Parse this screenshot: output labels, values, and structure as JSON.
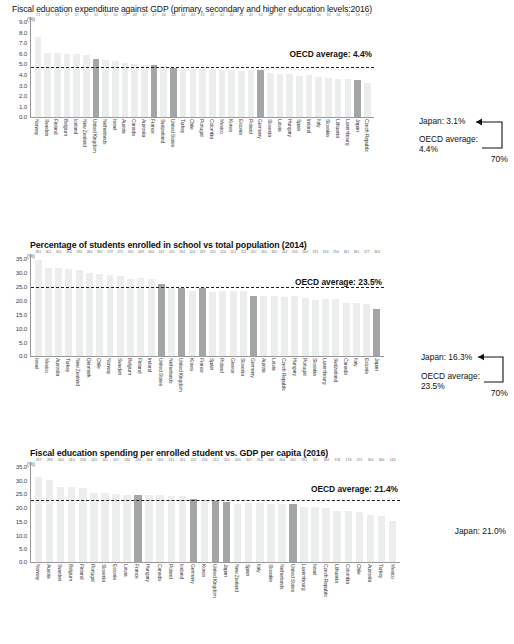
{
  "charts": [
    {
      "id": "chart-gdp-expenditure",
      "title": "Fiscal education expenditure against GDP (primary, secondary and higher education levels:2016)",
      "unit": "(%)",
      "average_label": "OECD average: 4.4%",
      "annotation": {
        "japan": "Japan: 3.1%",
        "oecd_line1": "OECD average:",
        "oecd_line2": "4.4%",
        "rank": "70%"
      },
      "chart_data": {
        "type": "bar",
        "title": "Fiscal education expenditure against GDP (primary, secondary and higher education levels:2016)",
        "xlabel": "",
        "ylabel": "(%)",
        "ylim": [
          0.0,
          9.0
        ],
        "yticks": [
          "0.0",
          "1.0",
          "2.0",
          "3.0",
          "4.0",
          "5.0",
          "6.0",
          "7.0",
          "8.0",
          "9.0"
        ],
        "grid": false,
        "legend": "none",
        "average_line": 4.4,
        "highlight": [
          "United Kingdom",
          "France",
          "United States",
          "Germany",
          "Japan"
        ],
        "categories": [
          "Norway",
          "Sweden",
          "Finland",
          "Belgium",
          "Iceland",
          "New Zealand",
          "United Kingdom",
          "Netherlands",
          "Israel",
          "Austria",
          "Canada",
          "Australia",
          "France",
          "Switzerland",
          "United States",
          "Turkey",
          "Chile",
          "Portugal",
          "Colombia",
          "Mexico",
          "Korea",
          "Estonia",
          "Poland",
          "Germany",
          "Slovenia",
          "Latvia",
          "Hungary",
          "Spain",
          "Ireland",
          "Italy",
          "Slovakia",
          "Lithuania",
          "Luxembourg",
          "Japan",
          "Czech Republic"
        ],
        "values": [
          7.2,
          5.8,
          5.8,
          5.7,
          5.7,
          5.6,
          5.2,
          5.1,
          5.0,
          4.9,
          4.8,
          4.7,
          4.7,
          4.6,
          4.4,
          4.4,
          4.3,
          4.3,
          4.3,
          4.2,
          4.2,
          4.1,
          4.2,
          4.2,
          4.0,
          3.9,
          3.9,
          3.7,
          3.8,
          3.6,
          3.5,
          3.4,
          3.4,
          3.3,
          3.1,
          3.1
        ],
        "value_labels": [
          "7.2",
          "5.8",
          "5.8",
          "5.7",
          "5.7",
          "5.6",
          "5.2",
          "5.1",
          "5.0",
          "4.9",
          "4.8",
          "4.7",
          "4.7",
          "4.6",
          "4.4",
          "4.4",
          "4.3",
          "4.3",
          "4.3",
          "4.2",
          "4.2",
          "4.1",
          "4.2",
          "4.2",
          "4.0",
          "3.9",
          "3.9",
          "3.7",
          "3.8",
          "3.6",
          "3.5",
          "3.4",
          "3.4",
          "3.3",
          "3.1"
        ]
      }
    },
    {
      "id": "chart-students-enrolled",
      "title": "Percentage of students enrolled in school vs total population (2014)",
      "unit": "(%)",
      "average_label": "OECD average: 23.5%",
      "annotation": {
        "japan": "Japan: 16.3%",
        "oecd_line1": "OECD average:",
        "oecd_line2": "23.5%",
        "rank": "70%"
      },
      "chart_data": {
        "type": "bar",
        "title": "Percentage of students enrolled in school vs total population (2014)",
        "xlabel": "",
        "ylabel": "(%)",
        "ylim": [
          0.0,
          35.0
        ],
        "yticks": [
          "0.0",
          "5.0",
          "10.0",
          "15.0",
          "20.0",
          "25.0",
          "30.0",
          "35.0"
        ],
        "grid": false,
        "legend": "none",
        "average_line": 23.5,
        "highlight": [
          "United States",
          "United Kingdom",
          "France",
          "Germany",
          "Japan"
        ],
        "categories": [
          "Israel",
          "Mexico",
          "Australia",
          "Turkey",
          "New Zealand",
          "Denmark",
          "Chile",
          "Norway",
          "Sweden",
          "Belgium",
          "Finland",
          "Ireland",
          "United States",
          "Netherlands",
          "United Kingdom",
          "Korea",
          "France",
          "Spain",
          "Poland",
          "Greece",
          "Slovenia",
          "Germany",
          "Austria",
          "Latvia",
          "Czech Republic",
          "Hungary",
          "Portugal",
          "Slovakia",
          "Luxembourg",
          "Switzerland",
          "Canada",
          "Italy",
          "Estonia",
          "Japan"
        ],
        "values": [
          33.1,
          30.1,
          30.1,
          30.0,
          29.5,
          28.4,
          28.2,
          27.9,
          27.5,
          26.5,
          26.9,
          26.4,
          24.7,
          23.5,
          23.4,
          22.4,
          23.3,
          22.0,
          22.4,
          22.3,
          22.4,
          20.7,
          20.5,
          20.5,
          20.4,
          20.5,
          20.0,
          19.1,
          19.4,
          19.4,
          18.1,
          18.1,
          17.7,
          16.3
        ],
        "value_labels": [
          "33.1",
          "30.1",
          "30.1",
          "30.0",
          "29.5",
          "28.4",
          "28.2",
          "27.9",
          "27.5",
          "26.5",
          "26.9",
          "26.4",
          "24.7",
          "23.5",
          "23.4",
          "22.4",
          "23.3",
          "22.0",
          "22.4",
          "22.3",
          "22.4",
          "20.7",
          "20.5",
          "20.5",
          "20.4",
          "20.5",
          "20.0",
          "19.1",
          "19.4",
          "19.4",
          "18.1",
          "18.1",
          "17.7",
          "16.3"
        ]
      }
    },
    {
      "id": "chart-spending-per-student",
      "title": "Fiscal education spending per enrolled student vs. GDP per capita (2016)",
      "unit": "(%)",
      "average_label": "OECD average: 21.4%",
      "annotation": {
        "japan": "Japan: 21.0%"
      },
      "chart_data": {
        "type": "bar",
        "title": "Fiscal education spending per enrolled student vs. GDP per capita (2016)",
        "xlabel": "",
        "ylabel": "(%)",
        "ylim": [
          0.0,
          35.0
        ],
        "yticks": [
          "0.0",
          "5.0",
          "10.0",
          "15.0",
          "20.0",
          "25.0",
          "30.0",
          "35.0"
        ],
        "grid": false,
        "legend": "none",
        "average_line": 21.4,
        "highlight": [
          "France",
          "Germany",
          "United Kingdom",
          "Japan",
          "United States"
        ],
        "categories": [
          "Norway",
          "Austria",
          "Sweden",
          "Belgium",
          "Finland",
          "Portugal",
          "Slovenia",
          "Estonia",
          "Latvia",
          "France",
          "Hungary",
          "Canada",
          "Poland",
          "Iceland",
          "Germany",
          "Korea",
          "United Kingdom",
          "Japan",
          "New Zealand",
          "Spain",
          "Italy",
          "Slovakia",
          "Netherlands",
          "United States",
          "Luxembourg",
          "Israel",
          "Czech Republic",
          "Lithuania",
          "Colombia",
          "Chile",
          "Australia",
          "Turkey",
          "Mexico"
        ],
        "values": [
          29.7,
          28.8,
          26.4,
          26.3,
          25.8,
          24.3,
          24.1,
          23.7,
          23.6,
          23.6,
          23.4,
          23.3,
          23.1,
          23.1,
          21.9,
          21.6,
          21.2,
          21.0,
          20.3,
          20.7,
          20.5,
          20.4,
          20.4,
          20.2,
          19.2,
          19.2,
          18.8,
          17.8,
          17.8,
          17.5,
          16.4,
          16.0,
          14.3
        ],
        "value_labels": [
          "29.7",
          "28.8",
          "26.4",
          "26.3",
          "25.8",
          "24.3",
          "24.1",
          "23.7",
          "23.6",
          "23.6",
          "23.4",
          "23.3",
          "23.1",
          "23.1",
          "21.9",
          "21.6",
          "21.2",
          "21.0",
          "20.3",
          "20.7",
          "20.5",
          "20.4",
          "20.4",
          "20.2",
          "19.2",
          "19.2",
          "18.8",
          "17.8",
          "17.8",
          "17.5",
          "16.4",
          "16.0",
          "14.3"
        ]
      }
    }
  ]
}
